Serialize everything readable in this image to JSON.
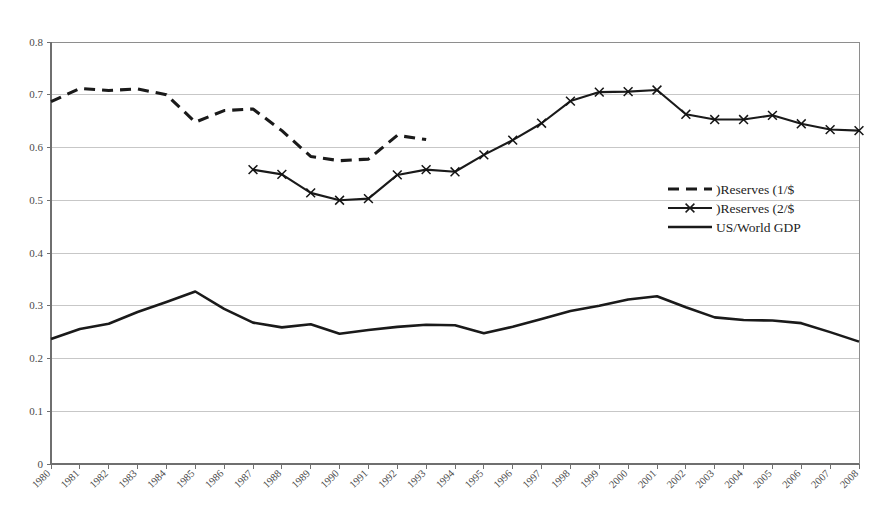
{
  "chart_data": {
    "type": "line",
    "title": "",
    "subtitle": "",
    "xlabel": "",
    "ylabel": "",
    "xlim": [
      1980,
      2008
    ],
    "ylim": [
      0,
      0.8
    ],
    "grid": true,
    "grid_axis": "y",
    "legend_position": "center-right-inside",
    "background": "#ffffff",
    "line_color": "#1a1a1a",
    "gridline_color": "#b9b9b9",
    "axis_color": "#6f6f6f",
    "categories": [
      "1980",
      "1981",
      "1982",
      "1983",
      "1984",
      "1985",
      "1986",
      "1987",
      "1988",
      "1989",
      "1990",
      "1991",
      "1992",
      "1993",
      "1994",
      "1995",
      "1996",
      "1997",
      "1998",
      "1999",
      "2000",
      "2001",
      "2002",
      "2003",
      "2004",
      "2005",
      "2006",
      "2007",
      "2008"
    ],
    "x": [
      1980,
      1981,
      1982,
      1983,
      1984,
      1985,
      1986,
      1987,
      1988,
      1989,
      1990,
      1991,
      1992,
      1993,
      1994,
      1995,
      1996,
      1997,
      1998,
      1999,
      2000,
      2001,
      2002,
      2003,
      2004,
      2005,
      2006,
      2007,
      2008
    ],
    "y_ticks": [
      0,
      0.1,
      0.2,
      0.3,
      0.4,
      0.5,
      0.6,
      0.7,
      0.8
    ],
    "y_tick_labels": [
      "0",
      "0.1",
      "0.2",
      "0.3",
      "0.4",
      "0.5",
      "0.6",
      "0.7",
      "0.8"
    ],
    "series": [
      {
        "name": ")Reserves (1/$",
        "style": "dashed",
        "marker": "none",
        "color": "#1a1a1a",
        "x": [
          1980,
          1981,
          1982,
          1983,
          1984,
          1985,
          1986,
          1987,
          1988,
          1989,
          1990,
          1991,
          1992,
          1993
        ],
        "values": [
          0.687,
          0.712,
          0.708,
          0.711,
          0.7,
          0.648,
          0.67,
          0.673,
          0.632,
          0.583,
          0.575,
          0.578,
          0.623,
          0.615
        ]
      },
      {
        "name": ")Reserves (2/$",
        "style": "solid",
        "marker": "x",
        "color": "#1a1a1a",
        "x": [
          1987,
          1988,
          1989,
          1990,
          1991,
          1992,
          1993,
          1994,
          1995,
          1996,
          1997,
          1998,
          1999,
          2000,
          2001,
          2002,
          2003,
          2004,
          2005,
          2006,
          2007,
          2008
        ],
        "values": [
          0.558,
          0.549,
          0.514,
          0.5,
          0.503,
          0.548,
          0.558,
          0.554,
          0.586,
          0.614,
          0.646,
          0.688,
          0.705,
          0.706,
          0.709,
          0.663,
          0.653,
          0.653,
          0.661,
          0.645,
          0.634,
          0.632
        ]
      },
      {
        "name": "US/World GDP",
        "style": "solid",
        "marker": "none",
        "color": "#1a1a1a",
        "x": [
          1980,
          1981,
          1982,
          1983,
          1984,
          1985,
          1986,
          1987,
          1988,
          1989,
          1990,
          1991,
          1992,
          1993,
          1994,
          1995,
          1996,
          1997,
          1998,
          1999,
          2000,
          2001,
          2002,
          2003,
          2004,
          2005,
          2006,
          2007,
          2008
        ],
        "values": [
          0.237,
          0.256,
          0.266,
          0.288,
          0.307,
          0.327,
          0.294,
          0.268,
          0.259,
          0.265,
          0.247,
          0.254,
          0.26,
          0.264,
          0.263,
          0.248,
          0.26,
          0.275,
          0.29,
          0.3,
          0.312,
          0.318,
          0.297,
          0.278,
          0.273,
          0.272,
          0.267,
          0.25,
          0.232
        ]
      }
    ],
    "legend": [
      {
        "label": ")Reserves (1/$",
        "style": "dashed",
        "marker": "none"
      },
      {
        "label": ")Reserves (2/$",
        "style": "solid",
        "marker": "x"
      },
      {
        "label": "US/World GDP",
        "style": "solid",
        "marker": "none"
      }
    ]
  }
}
